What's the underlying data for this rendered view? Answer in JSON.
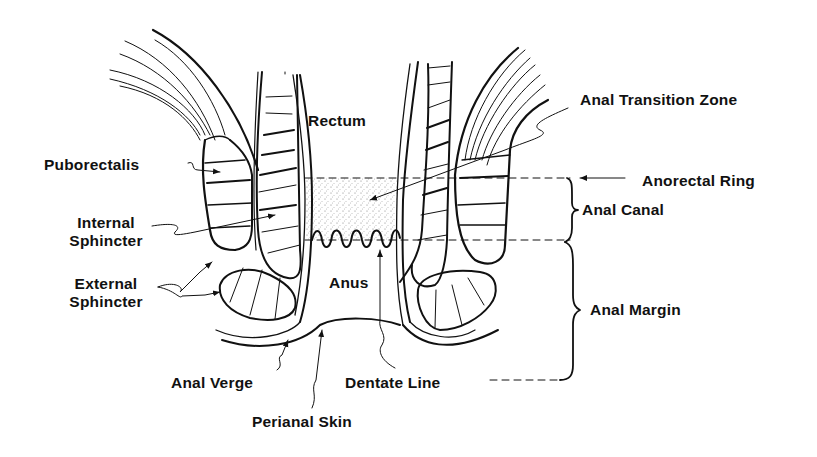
{
  "diagram": {
    "background": "#ffffff",
    "ink": "#111111",
    "labels": {
      "rectum": "Rectum",
      "anal_transition_zone": "Anal Transition Zone",
      "anorectal_ring": "Anorectal Ring",
      "anal_canal": "Anal Canal",
      "puborectalis": "Puborectalis",
      "internal_sphincter_1": "Internal",
      "internal_sphincter_2": "Sphincter",
      "external_sphincter_1": "External",
      "external_sphincter_2": "Sphincter",
      "anus": "Anus",
      "anal_margin": "Anal Margin",
      "anal_verge": "Anal Verge",
      "dentate_line": "Dentate Line",
      "perianal_skin": "Perianal Skin"
    }
  }
}
